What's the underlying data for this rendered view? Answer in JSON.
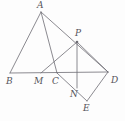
{
  "figure": {
    "type": "geometry-diagram",
    "width": 125,
    "height": 121,
    "background_color": "#fdfdfd",
    "stroke_color": "#6d6c73",
    "label_color": "#55545a",
    "stroke_width": 0.8,
    "points": [
      {
        "id": "A",
        "label": "A",
        "x": 41,
        "y": 12,
        "label_x": 37,
        "label_y": 1,
        "marker": false
      },
      {
        "id": "B",
        "label": "B",
        "x": 10,
        "y": 73,
        "label_x": 6,
        "label_y": 77,
        "marker": false
      },
      {
        "id": "M",
        "label": "M",
        "x": 41,
        "y": 73,
        "label_x": 34,
        "label_y": 77,
        "marker": false
      },
      {
        "id": "C",
        "label": "C",
        "x": 57,
        "y": 73,
        "label_x": 52,
        "label_y": 77,
        "marker": false
      },
      {
        "id": "D",
        "label": "D",
        "x": 108,
        "y": 72,
        "label_x": 111,
        "label_y": 76,
        "marker": false
      },
      {
        "id": "P",
        "label": "P",
        "x": 77,
        "y": 42,
        "label_x": 75,
        "label_y": 29,
        "marker": true
      },
      {
        "id": "N",
        "label": "N",
        "x": 77,
        "y": 88,
        "label_x": 70,
        "label_y": 90,
        "marker": false
      },
      {
        "id": "E",
        "label": "E",
        "x": 87,
        "y": 101,
        "label_x": 83,
        "label_y": 104,
        "marker": false
      }
    ],
    "segments": [
      {
        "name": "segment-B-D",
        "from": "B",
        "to": "D"
      },
      {
        "name": "segment-A-B",
        "from": "A",
        "to": "B"
      },
      {
        "name": "segment-A-C",
        "from": "A",
        "to": "C"
      },
      {
        "name": "segment-A-D",
        "from": "A",
        "to": "D"
      },
      {
        "name": "segment-M-P",
        "from": "M",
        "to": "P"
      },
      {
        "name": "segment-P-N",
        "from": "P",
        "to": "N"
      },
      {
        "name": "segment-P-D",
        "from": "P",
        "to": "D"
      },
      {
        "name": "segment-C-E",
        "from": "C",
        "to": "E"
      },
      {
        "name": "segment-D-E",
        "from": "D",
        "to": "E"
      }
    ]
  }
}
